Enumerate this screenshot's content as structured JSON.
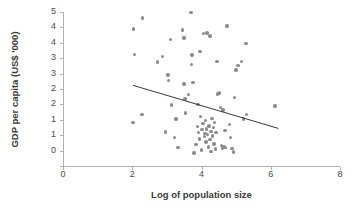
{
  "chart_data": {
    "type": "scatter",
    "title": "",
    "xlabel": "Log of population size",
    "ylabel": "GDP per capita (US$ '000)",
    "xlim": [
      0,
      8
    ],
    "ylim": [
      0,
      5
    ],
    "xticks": [
      "0",
      "2",
      "4",
      "6",
      "8"
    ],
    "xtick_values": [
      0,
      2,
      4,
      6,
      8
    ],
    "yticks": [
      "5",
      "4",
      "4",
      "3",
      "3",
      "2",
      "2",
      "1",
      "1",
      "0"
    ],
    "ytick_values": [
      5.0,
      4.5,
      4.0,
      3.5,
      3.0,
      2.5,
      2.0,
      1.5,
      1.0,
      0.5,
      0.0
    ],
    "grid": false,
    "legend": null,
    "marker_color": "#8c8c8c",
    "axis_color": "#b0b0b0",
    "trendline": {
      "color": "#3a3a3a",
      "x_start": 2.02,
      "y_start": 2.62,
      "x_end": 6.22,
      "y_end": 1.22,
      "slope": -0.333,
      "intercept": 3.293
    },
    "points": [
      [
        2.03,
        4.45
      ],
      [
        2.3,
        4.8
      ],
      [
        2.06,
        3.62
      ],
      [
        2.02,
        1.42
      ],
      [
        2.28,
        1.68
      ],
      [
        2.73,
        3.38
      ],
      [
        2.87,
        3.55
      ],
      [
        2.96,
        1.1
      ],
      [
        3.03,
        2.95
      ],
      [
        3.05,
        2.78
      ],
      [
        3.1,
        4.1
      ],
      [
        3.13,
        1.98
      ],
      [
        3.22,
        0.92
      ],
      [
        3.26,
        1.52
      ],
      [
        3.32,
        0.6
      ],
      [
        3.46,
        4.42
      ],
      [
        3.5,
        4.15
      ],
      [
        3.5,
        2.66
      ],
      [
        3.52,
        2.18
      ],
      [
        3.54,
        1.72
      ],
      [
        3.62,
        2.32
      ],
      [
        3.7,
        4.98
      ],
      [
        3.71,
        3.3
      ],
      [
        3.73,
        3.6
      ],
      [
        3.76,
        2.72
      ],
      [
        3.78,
        0.42
      ],
      [
        3.84,
        0.7
      ],
      [
        3.88,
        1.28
      ],
      [
        3.9,
        2.0
      ],
      [
        3.92,
        1.08
      ],
      [
        3.95,
        0.88
      ],
      [
        3.96,
        3.72
      ],
      [
        3.98,
        1.6
      ],
      [
        4.0,
        0.52
      ],
      [
        4.02,
        1.18
      ],
      [
        4.04,
        1.38
      ],
      [
        4.05,
        4.3
      ],
      [
        4.08,
        0.96
      ],
      [
        4.1,
        1.05
      ],
      [
        4.12,
        1.48
      ],
      [
        4.13,
        0.78
      ],
      [
        4.15,
        1.2
      ],
      [
        4.16,
        4.32
      ],
      [
        4.18,
        1.02
      ],
      [
        4.2,
        0.62
      ],
      [
        4.22,
        1.3
      ],
      [
        4.24,
        4.22
      ],
      [
        4.25,
        0.86
      ],
      [
        4.27,
        1.12
      ],
      [
        4.28,
        0.48
      ],
      [
        4.3,
        1.55
      ],
      [
        4.32,
        0.98
      ],
      [
        4.34,
        1.25
      ],
      [
        4.36,
        0.72
      ],
      [
        4.38,
        1.42
      ],
      [
        4.4,
        0.55
      ],
      [
        4.42,
        1.08
      ],
      [
        4.45,
        3.4
      ],
      [
        4.46,
        2.34
      ],
      [
        4.5,
        2.36
      ],
      [
        4.52,
        2.38
      ],
      [
        4.55,
        1.9
      ],
      [
        4.58,
        0.66
      ],
      [
        4.6,
        0.58
      ],
      [
        4.62,
        1.82
      ],
      [
        4.65,
        0.62
      ],
      [
        4.68,
        1.16
      ],
      [
        4.7,
        0.6
      ],
      [
        4.74,
        4.55
      ],
      [
        4.8,
        1.34
      ],
      [
        4.84,
        0.92
      ],
      [
        4.88,
        0.56
      ],
      [
        4.92,
        0.45
      ],
      [
        4.96,
        2.22
      ],
      [
        5.0,
        3.12
      ],
      [
        5.05,
        3.26
      ],
      [
        5.16,
        3.4
      ],
      [
        5.22,
        1.52
      ],
      [
        5.28,
        3.98
      ],
      [
        5.3,
        1.68
      ],
      [
        6.12,
        1.95
      ]
    ]
  }
}
